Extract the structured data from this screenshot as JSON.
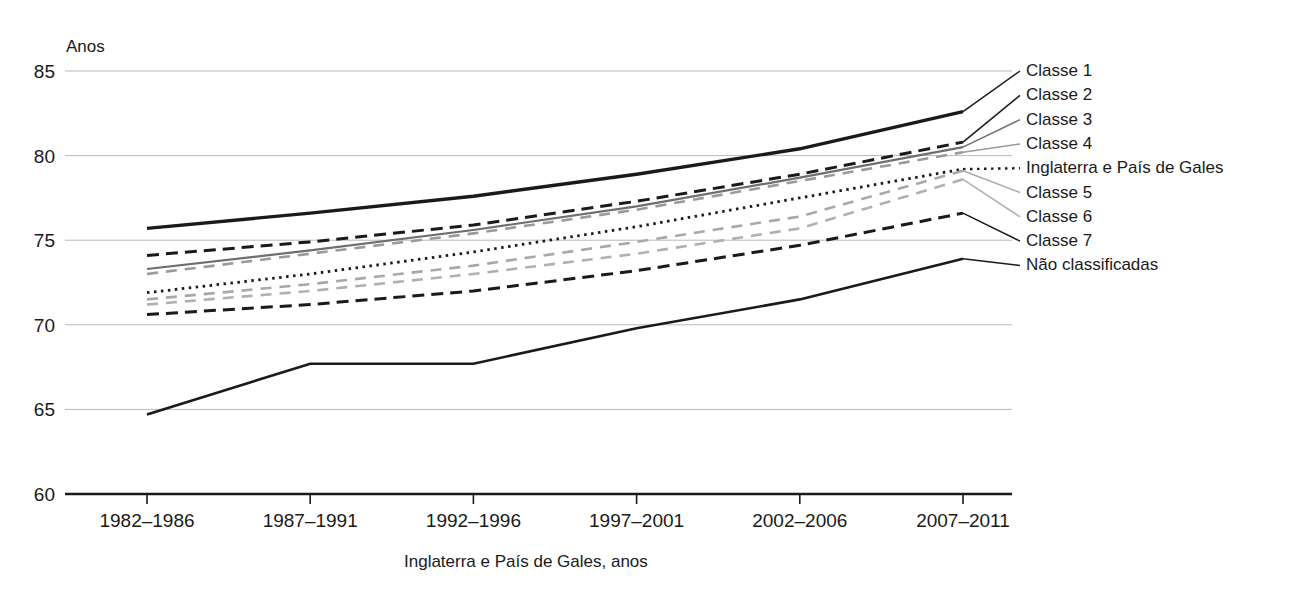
{
  "chart_data": {
    "type": "line",
    "title": "",
    "ylabel": "Anos",
    "xlabel": "Inglaterra e País de Gales, anos",
    "ylim": [
      60,
      85
    ],
    "yticks": [
      60,
      65,
      70,
      75,
      80,
      85
    ],
    "ytick_labels": [
      "60",
      "65",
      "70",
      "75",
      "80",
      "85"
    ],
    "grid": true,
    "legend_position": "right",
    "categories": [
      "1982–1986",
      "1987–1991",
      "1992–1996",
      "1997–2001",
      "2002–2006",
      "2007–2011"
    ],
    "series": [
      {
        "name": "Classe 1",
        "values": [
          75.7,
          76.6,
          77.6,
          78.9,
          80.4,
          82.6
        ],
        "style": "solid-thick",
        "color": "#1a1a1a"
      },
      {
        "name": "Classe 2",
        "values": [
          74.1,
          74.9,
          75.9,
          77.3,
          78.9,
          80.8
        ],
        "style": "dashed",
        "color": "#1a1a1a"
      },
      {
        "name": "Classe 3",
        "values": [
          73.3,
          74.4,
          75.6,
          77.0,
          78.7,
          80.5
        ],
        "style": "solid-medium",
        "color": "#6e6e6e"
      },
      {
        "name": "Classe 4",
        "values": [
          73.0,
          74.2,
          75.4,
          76.8,
          78.5,
          80.2
        ],
        "style": "dashed-gray",
        "color": "#9a9a9a"
      },
      {
        "name": "Inglaterra e País de Gales",
        "values": [
          71.9,
          73.0,
          74.3,
          75.8,
          77.5,
          79.2
        ],
        "style": "dotted",
        "color": "#1a1a1a"
      },
      {
        "name": "Classe 5",
        "values": [
          71.5,
          72.4,
          73.5,
          74.9,
          76.4,
          79.1
        ],
        "style": "dashed-gray",
        "color": "#a8a8a8"
      },
      {
        "name": "Classe 6",
        "values": [
          71.2,
          72.0,
          73.0,
          74.2,
          75.7,
          78.6
        ],
        "style": "dashed-gray",
        "color": "#b0b0b0"
      },
      {
        "name": "Classe 7",
        "values": [
          70.6,
          71.2,
          72.0,
          73.2,
          74.7,
          76.6
        ],
        "style": "dashed",
        "color": "#1a1a1a"
      },
      {
        "name": "Não classificadas",
        "values": [
          64.7,
          67.7,
          67.7,
          69.8,
          71.5,
          73.9
        ],
        "style": "solid-dark",
        "color": "#1a1a1a"
      }
    ],
    "legend_entries": [
      "Classe 1",
      "Classe 2",
      "Classe 3",
      "Classe 4",
      "Inglaterra e País de Gales",
      "Classe 5",
      "Classe 6",
      "Classe 7",
      "Não classificadas"
    ]
  },
  "axis": {
    "y_unit": "Anos",
    "x_caption": "Inglaterra e País de Gales, anos"
  },
  "colors": {
    "ink": "#1a1a1a",
    "grid": "#b9b9b9",
    "gray_mid": "#6e6e6e",
    "gray_light": "#a8a8a8",
    "background": "#ffffff"
  }
}
